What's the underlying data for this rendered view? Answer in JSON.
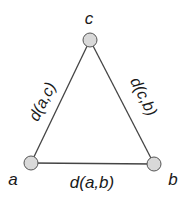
{
  "diagram": {
    "type": "triangle-metric",
    "nodes": [
      {
        "id": "a",
        "label": "a",
        "x": 31,
        "y": 163
      },
      {
        "id": "b",
        "label": "b",
        "x": 154,
        "y": 164
      },
      {
        "id": "c",
        "label": "c",
        "x": 90,
        "y": 40
      }
    ],
    "edges": [
      {
        "from": "a",
        "to": "c",
        "label": "d(a,c)"
      },
      {
        "from": "c",
        "to": "b",
        "label": "d(c,b)"
      },
      {
        "from": "a",
        "to": "b",
        "label": "d(a,b)"
      }
    ],
    "colors": {
      "node_fill": "#d9d9d9",
      "node_stroke": "#555555",
      "edge": "#444444",
      "text": "#1a1a1a"
    }
  }
}
